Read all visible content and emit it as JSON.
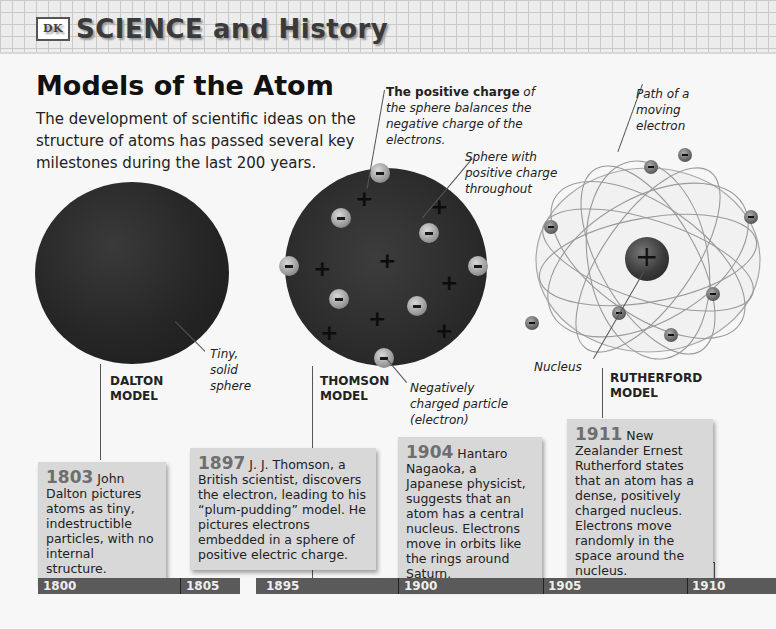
{
  "banner": {
    "logo": "DK",
    "title": "SCIENCE and History"
  },
  "page": {
    "title": "Models of the Atom",
    "intro": "The development of scientific ideas on the structure of atoms has passed several key milestones during the last 200 years."
  },
  "captions": {
    "positive_charge_bold": "The positive charge",
    "positive_charge_rest": " of the sphere balances the negative charge of the electrons.",
    "sphere_positive": "Sphere with positive charge throughout",
    "path_electron": "Path of a moving electron",
    "tiny_solid": "Tiny, solid sphere",
    "negative_particle": "Negatively charged particle (electron)",
    "nucleus": "Nucleus"
  },
  "models": {
    "dalton": "DALTON MODEL",
    "thomson": "THOMSON MODEL",
    "rutherford": "RUTHERFORD MODEL"
  },
  "symbols": {
    "plus": "+"
  },
  "events": [
    {
      "year": "1803",
      "text": " John Dalton pictures atoms as tiny, indestructible particles, with no internal structure."
    },
    {
      "year": "1897",
      "text": " J. J. Thomson, a British scientist, discovers the electron, leading to his “plum-pudding” model. He pictures electrons embedded in a sphere of positive electric charge."
    },
    {
      "year": "1904",
      "text": " Hantaro Nagaoka, a Japanese physicist, suggests that an atom has a central nucleus. Electrons move in orbits like the rings around Saturn."
    },
    {
      "year": "1911",
      "text": " New Zealander Ernest Rutherford states that an atom has a dense, positively charged nucleus. Electrons move randomly in the space around the nucleus."
    }
  ],
  "timeline": {
    "labels": [
      "1800",
      "1805",
      "1895",
      "1900",
      "1905",
      "1910"
    ]
  },
  "colors": {
    "timeline": "#5a5a5a",
    "box": "#d8d8d8",
    "year": "#6e6e6e"
  }
}
